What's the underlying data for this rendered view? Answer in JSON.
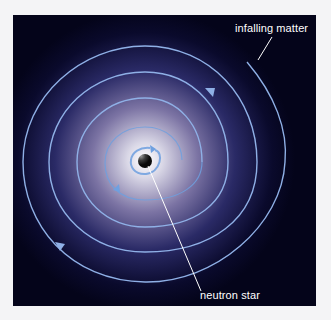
{
  "figure": {
    "background_color": "#f4f4f6",
    "panel_color": "#04041a",
    "glow_color": "#d8d6e8",
    "spiral_color": "#8fb0e6",
    "inner_spiral_color": "#6fa0e0",
    "labels": {
      "infalling_matter": "infalling matter",
      "neutron_star": "neutron star"
    },
    "elements": {
      "central_object": "neutron star",
      "disk": "accretion spiral of infalling matter",
      "arrows": "clockwise flow direction markers"
    }
  }
}
